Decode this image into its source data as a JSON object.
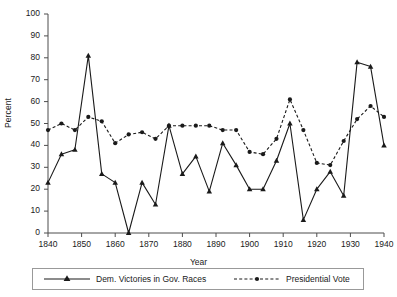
{
  "chart_data": {
    "type": "line",
    "title": "",
    "xlabel": "Year",
    "ylabel": "Percent",
    "xlim": [
      1840,
      1940
    ],
    "ylim": [
      0,
      100
    ],
    "grid": false,
    "legend_position": "bottom",
    "x": [
      1840,
      1844,
      1848,
      1852,
      1856,
      1860,
      1864,
      1868,
      1872,
      1876,
      1880,
      1884,
      1888,
      1892,
      1896,
      1900,
      1904,
      1908,
      1912,
      1916,
      1920,
      1924,
      1928,
      1932,
      1936,
      1940
    ],
    "xticks": [
      "1840",
      "1850",
      "1860",
      "1870",
      "1880",
      "1890",
      "1900",
      "1910",
      "1920",
      "1930",
      "1940"
    ],
    "yticks": [
      "0",
      "10",
      "20",
      "30",
      "40",
      "50",
      "60",
      "70",
      "80",
      "90",
      "100"
    ],
    "series": [
      {
        "name": "Dem. Victories in Gov. Races",
        "style": "solid",
        "marker": "triangle",
        "color": "#1a1a1a",
        "values": [
          23,
          36,
          38,
          81,
          27,
          23,
          0,
          23,
          13,
          49,
          27,
          35,
          19,
          41,
          31,
          20,
          20,
          33,
          50,
          6,
          20,
          28,
          17,
          78,
          76,
          40
        ]
      },
      {
        "name": "Presidential Vote",
        "style": "dashed",
        "marker": "circle",
        "color": "#1a1a1a",
        "values": [
          47,
          50,
          47,
          53,
          51,
          41,
          45,
          46,
          43,
          49,
          49,
          49,
          49,
          47,
          47,
          37,
          36,
          43,
          61,
          47,
          32,
          31,
          42,
          52,
          58,
          53
        ]
      }
    ]
  },
  "legend": {
    "items": [
      {
        "label": "Dem. Victories in Gov. Races"
      },
      {
        "label": "Presidential Vote"
      }
    ]
  }
}
